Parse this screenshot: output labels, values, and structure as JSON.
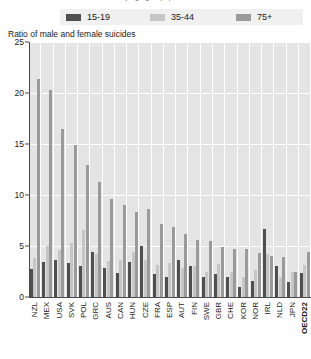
{
  "top_caption": "ratio of male and female suicides by age group, per selected countries",
  "axis_title": "Ratio of male and female suicides",
  "legend": {
    "items": [
      {
        "label": "15-19",
        "color": "#4f4f4f",
        "swatch_name": "legend-swatch-15-19"
      },
      {
        "label": "35-44",
        "color": "#c6c6c6",
        "swatch_name": "legend-swatch-35-44"
      },
      {
        "label": "75+",
        "color": "#9a9a9a",
        "swatch_name": "legend-swatch-75plus"
      }
    ]
  },
  "chart_data": {
    "type": "bar",
    "title": "Ratio of male and female suicides",
    "xlabel": "",
    "ylabel": "Ratio of male and female suicides",
    "ylim": [
      0,
      25
    ],
    "yticks": [
      0,
      5,
      10,
      15,
      20,
      25
    ],
    "grid": true,
    "legend_position": "top",
    "categories": [
      "NZL",
      "MEX",
      "USA",
      "SVK",
      "POL",
      "GRC",
      "AUS",
      "CAN",
      "HUN",
      "CZE",
      "FRA",
      "ESP",
      "AUT",
      "FIN",
      "SWE",
      "GBR",
      "CHE",
      "KOR",
      "NOR",
      "IRL",
      "NLD",
      "JPN",
      "OECD22"
    ],
    "series": [
      {
        "name": "15-19",
        "color": "#4f4f4f",
        "values": [
          2.7,
          3.4,
          3.6,
          3.3,
          3.0,
          4.4,
          2.8,
          2.4,
          3.4,
          5.0,
          2.3,
          2.0,
          3.6,
          3.0,
          2.0,
          2.3,
          2.0,
          1.0,
          1.6,
          6.7,
          3.0,
          1.5,
          2.4
        ]
      },
      {
        "name": "35-44",
        "color": "#c6c6c6",
        "values": [
          3.8,
          5.0,
          4.6,
          5.3,
          6.6,
          4.2,
          3.5,
          3.6,
          4.4,
          3.6,
          3.1,
          3.3,
          2.8,
          3.0,
          2.5,
          3.2,
          2.5,
          2.0,
          2.6,
          4.2,
          2.0,
          2.5,
          3.1
        ]
      },
      {
        "name": "75+",
        "color": "#9a9a9a",
        "values": [
          21.4,
          20.3,
          16.5,
          14.9,
          12.9,
          11.3,
          9.6,
          9.0,
          8.3,
          8.6,
          7.2,
          6.9,
          6.2,
          5.6,
          5.5,
          4.9,
          4.7,
          4.7,
          4.3,
          4.0,
          3.9,
          2.5,
          4.4
        ]
      }
    ]
  }
}
